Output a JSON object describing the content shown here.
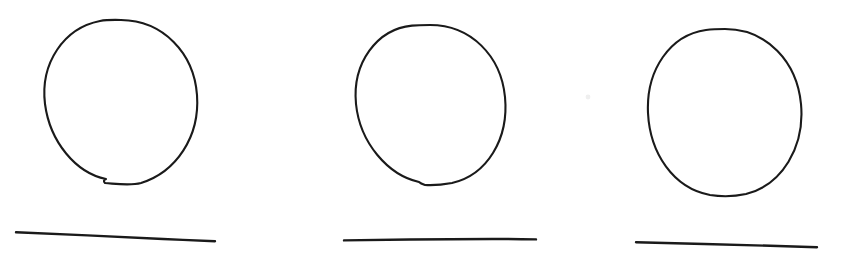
{
  "canvas": {
    "width": 850,
    "height": 256,
    "background_color": "#ffffff",
    "description": "Hand-drawn sketch: three circles each drawn above a straight horizontal line"
  },
  "style": {
    "stroke_color": "#1a1a1a",
    "stroke_width": 2.1,
    "line_stroke_width": 2.4,
    "speck_color": "#efefef"
  },
  "chart_data": {
    "type": "scatter",
    "title": "",
    "subtitle": "",
    "xlabel": "",
    "ylabel": "",
    "grid": false,
    "legend": null,
    "xlim": [
      0,
      850
    ],
    "ylim": [
      0,
      256
    ],
    "annotations": [],
    "groups": [
      {
        "name": "figure-1",
        "circle": {
          "cx": 121,
          "cy": 104,
          "rx": 77,
          "ry": 84
        },
        "line": {
          "x1": 16,
          "y1": 232,
          "x2": 215,
          "y2": 241
        }
      },
      {
        "name": "figure-2",
        "circle": {
          "cx": 430,
          "cy": 105,
          "rx": 75,
          "ry": 80
        },
        "line": {
          "x1": 344,
          "y1": 240,
          "x2": 536,
          "y2": 239
        }
      },
      {
        "name": "figure-3",
        "circle": {
          "cx": 725,
          "cy": 112,
          "rx": 77,
          "ry": 83
        },
        "line": {
          "x1": 636,
          "y1": 242,
          "x2": 817,
          "y2": 247
        }
      }
    ]
  },
  "shapes": {
    "circle_1": {
      "label": "circle-1",
      "path": "M 121 20 C 163 20.5 194 53 197 95 C 200 137 176 172 141 183 C 130 186 118 184 105 183 C 103 181 104 180 106 179 C 76 173 50 142 45 104 C 40 63 64 28 100 21 C 107 19.7 114 19.8 121 20 Z"
    },
    "circle_2": {
      "label": "circle-2",
      "path": "M 430 25 C 471 25 501 56 505 97 C 509 139 487 175 452 183 C 441 185 431 185.4 425 185 C 422 184 420 183 419 182 C 388 175 360 143 356 104 C 352 63 377 29 412 25.6 C 418 25 424 25 430 25 Z"
    },
    "circle_3": {
      "label": "circle-3",
      "path": "M 725 29 C 767 29 797 62 801 104 C 805 147 782 185 746 194 C 734 196.6 722 196.8 710 195 C 673 188 650 153 648 113 C 646 70 670 35 706 30 C 712 29.2 719 29 725 29 Z"
    },
    "line_1": {
      "label": "baseline-1",
      "path": "M 16 232.2 C 60 234 120 237 163 239 C 180 239.8 200 240.6 215 241.2"
    },
    "line_2": {
      "label": "baseline-2",
      "path": "M 344 240.4 C 390 239.6 450 239.2 492 239 C 508 239 524 239.2 536 239.4"
    },
    "line_3": {
      "label": "baseline-3",
      "path": "M 636 242.2 C 680 243.4 735 244.8 778 246 C 794 246.4 808 246.8 817 247.2"
    },
    "speck": {
      "label": "stray-mark",
      "cx": 588,
      "cy": 97,
      "r": 2.4
    }
  }
}
